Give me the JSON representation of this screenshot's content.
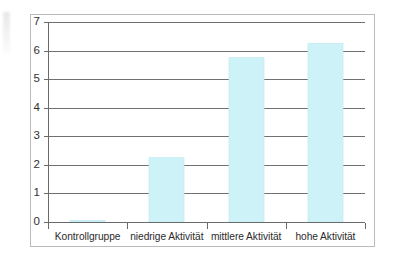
{
  "figure": {
    "background_color": "#ffffff",
    "frame_color": "#b9bcbe",
    "axis_color": "#6a6a6a",
    "gridline_color": "#6f6f6f",
    "bar_color": "#cdf3f8",
    "bar_edge_color": "#bfe9f0",
    "tick_text_color": "#2f2f2f"
  },
  "chart_data": {
    "type": "bar",
    "title": "",
    "subtitle": "",
    "xlabel": "",
    "ylabel": "",
    "categories": [
      "Kontrollgruppe",
      "niedrige Aktivität",
      "mittlere Aktivität",
      "hohe Aktivität"
    ],
    "values": [
      0.05,
      2.25,
      5.75,
      6.25
    ],
    "ylim": [
      0,
      7
    ],
    "ytick_labels": [
      "0",
      "1",
      "2",
      "3",
      "4",
      "5",
      "6",
      "7"
    ],
    "ytick_values": [
      0,
      1,
      2,
      3,
      4,
      5,
      6,
      7
    ],
    "grid": true,
    "grid_axis": "y",
    "legend": false,
    "legend_position": "none",
    "annotations": []
  }
}
